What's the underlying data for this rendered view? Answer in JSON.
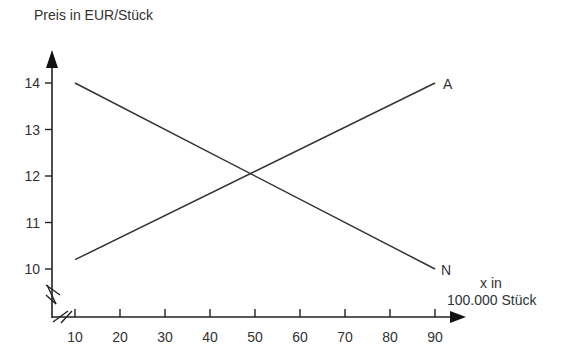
{
  "chart_data": {
    "type": "line",
    "title": "",
    "ylabel": "Preis in EUR/Stück",
    "xlabel_line1": "x in",
    "xlabel_line2": "100.000 Stück",
    "x_ticks": [
      10,
      20,
      30,
      40,
      50,
      60,
      70,
      80,
      90
    ],
    "y_ticks": [
      10,
      11,
      12,
      13,
      14
    ],
    "xlim": [
      10,
      90
    ],
    "ylim": [
      10,
      14
    ],
    "grid": false,
    "axis_breaks": true,
    "series": [
      {
        "name": "N",
        "x": [
          10,
          90
        ],
        "y": [
          14,
          10
        ]
      },
      {
        "name": "A",
        "x": [
          10,
          90
        ],
        "y": [
          10.2,
          14
        ]
      }
    ],
    "intersection": {
      "x": 50,
      "y": 12
    }
  },
  "labels": {
    "ylabel": "Preis in EUR/Stück",
    "xlabel_line1": "x in",
    "xlabel_line2": "100.000 Stück",
    "series_n": "N",
    "series_a": "A"
  },
  "colors": {
    "line": "#333333",
    "axis": "#222222"
  }
}
